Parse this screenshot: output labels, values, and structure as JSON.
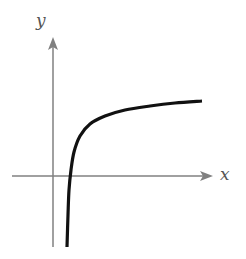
{
  "chart_data": {
    "type": "line",
    "title": "",
    "xlabel": "x",
    "ylabel": "y",
    "grid": false,
    "legend": "none",
    "series": [
      {
        "name": "f(x)",
        "points_px": [
          [
            67,
            247
          ],
          [
            68,
            215
          ],
          [
            69,
            190
          ],
          [
            71,
            170
          ],
          [
            74,
            152
          ],
          [
            80,
            136
          ],
          [
            90,
            124
          ],
          [
            105,
            116
          ],
          [
            125,
            110
          ],
          [
            150,
            106
          ],
          [
            175,
            103
          ],
          [
            202,
            101
          ]
        ]
      }
    ],
    "axes": {
      "x_axis": {
        "y_px": 176,
        "x_start_px": 12,
        "x_end_px": 213,
        "arrow": "right"
      },
      "y_axis": {
        "x_px": 53,
        "y_start_px": 247,
        "y_end_px": 37,
        "arrow": "up"
      }
    },
    "colors": {
      "axis": "#808080",
      "curve": "#111111",
      "label": "#555555"
    }
  }
}
